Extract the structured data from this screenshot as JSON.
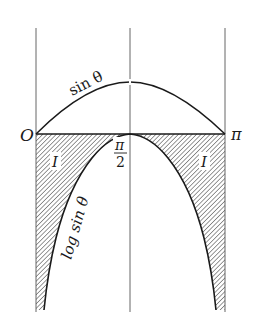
{
  "diagram": {
    "labels": {
      "origin": "O",
      "pi": "π",
      "half_pi_num": "π",
      "half_pi_den": "2",
      "sin_curve": "sin θ",
      "log_curve": "log sin θ",
      "region_left": "I",
      "region_right": "I"
    },
    "colors": {
      "line": "#1a1a1a",
      "guide": "#555555",
      "hatch": "#444444",
      "background": "#ffffff"
    },
    "axis": {
      "x_min_label": "O",
      "x_mid_label": "π/2",
      "x_max_label": "π"
    }
  }
}
